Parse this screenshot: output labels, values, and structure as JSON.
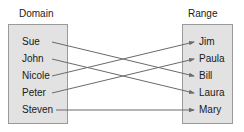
{
  "domain": {
    "title": "Domain",
    "items": [
      "Sue",
      "John",
      "Nicole",
      "Peter",
      "Steven"
    ]
  },
  "range": {
    "title": "Range",
    "items": [
      "Jim",
      "Paula",
      "Bill",
      "Laura",
      "Mary"
    ]
  },
  "mappings": [
    {
      "from": "Sue",
      "to": "Bill"
    },
    {
      "from": "John",
      "to": "Laura"
    },
    {
      "from": "Nicole",
      "to": "Jim"
    },
    {
      "from": "Peter",
      "to": "Paula"
    },
    {
      "from": "Steven",
      "to": "Mary"
    }
  ],
  "colors": {
    "box_fill": "#e2e2e2",
    "box_border": "#9a9a9a",
    "arrow": "#6a6a6a"
  }
}
